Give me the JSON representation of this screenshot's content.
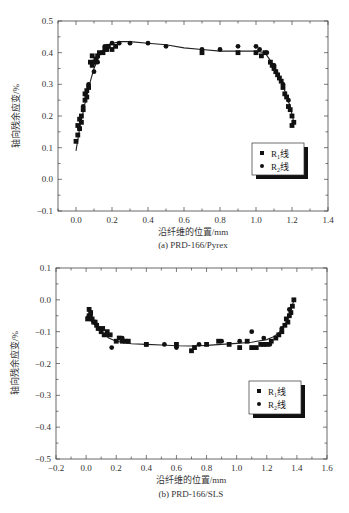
{
  "chart_data": [
    {
      "type": "scatter",
      "title": "",
      "caption": "(a) PRD-166/Pyrex",
      "xlabel": "沿纤维的位置/mm",
      "ylabel": "轴向残余应变/%",
      "xlim": [
        -0.1,
        1.4
      ],
      "ylim": [
        -0.1,
        0.5
      ],
      "xticks": [
        "0.0",
        "0.2",
        "0.4",
        "0.6",
        "0.8",
        "1.0",
        "1.2",
        "1.4"
      ],
      "xtick_values": [
        0.0,
        0.2,
        0.4,
        0.6,
        0.8,
        1.0,
        1.2,
        1.4
      ],
      "yticks": [
        "0.5",
        "0.4",
        "0.3",
        "0.2",
        "0.1",
        "0.0",
        "−0.1"
      ],
      "ytick_values": [
        0.5,
        0.4,
        0.3,
        0.2,
        0.1,
        0.0,
        -0.1
      ],
      "grid": false,
      "legend": {
        "position": "right-center",
        "entries": [
          {
            "marker": "square",
            "label_main": "R",
            "label_sub": "1",
            "label_tail": "线"
          },
          {
            "marker": "circle",
            "label_main": "R",
            "label_sub": "2",
            "label_tail": "线"
          }
        ]
      },
      "fit_curve": {
        "x": [
          0.0,
          0.02,
          0.05,
          0.08,
          0.1,
          0.13,
          0.16,
          0.2,
          0.25,
          0.3,
          0.4,
          0.5,
          0.6,
          0.7,
          0.8,
          0.9,
          1.0,
          1.05,
          1.08,
          1.1,
          1.13,
          1.16,
          1.19,
          1.21
        ],
        "y": [
          0.09,
          0.16,
          0.24,
          0.31,
          0.35,
          0.39,
          0.415,
          0.43,
          0.435,
          0.435,
          0.43,
          0.425,
          0.415,
          0.41,
          0.405,
          0.405,
          0.405,
          0.4,
          0.375,
          0.355,
          0.32,
          0.28,
          0.23,
          0.18
        ]
      },
      "series": [
        {
          "name": "R1线",
          "marker": "square",
          "x": [
            0.0,
            0.01,
            0.01,
            0.02,
            0.02,
            0.03,
            0.03,
            0.04,
            0.05,
            0.05,
            0.06,
            0.06,
            0.07,
            0.08,
            0.09,
            0.09,
            0.1,
            0.11,
            0.12,
            0.13,
            0.15,
            0.16,
            0.17,
            0.18,
            0.2,
            0.22,
            0.7,
            0.9,
            1.0,
            1.03,
            1.05,
            1.08,
            1.09,
            1.1,
            1.11,
            1.12,
            1.13,
            1.14,
            1.15,
            1.16,
            1.17,
            1.18,
            1.19,
            1.2,
            1.21,
            1.2
          ],
          "y": [
            0.12,
            0.14,
            0.17,
            0.16,
            0.19,
            0.2,
            0.18,
            0.22,
            0.25,
            0.27,
            0.26,
            0.28,
            0.29,
            0.37,
            0.36,
            0.39,
            0.37,
            0.38,
            0.39,
            0.4,
            0.4,
            0.41,
            0.41,
            0.42,
            0.41,
            0.42,
            0.4,
            0.4,
            0.4,
            0.39,
            0.4,
            0.37,
            0.36,
            0.35,
            0.34,
            0.33,
            0.32,
            0.31,
            0.29,
            0.27,
            0.26,
            0.23,
            0.22,
            0.2,
            0.18,
            0.17
          ]
        },
        {
          "name": "R2线",
          "marker": "circle",
          "x": [
            0.02,
            0.04,
            0.07,
            0.1,
            0.12,
            0.16,
            0.2,
            0.24,
            0.3,
            0.4,
            0.5,
            0.7,
            0.8,
            0.9,
            1.0,
            1.02,
            1.06,
            1.1,
            1.15,
            1.18
          ],
          "y": [
            0.16,
            0.23,
            0.3,
            0.34,
            0.37,
            0.42,
            0.43,
            0.43,
            0.43,
            0.43,
            0.42,
            0.41,
            0.41,
            0.42,
            0.42,
            0.41,
            0.4,
            0.36,
            0.3,
            0.25
          ]
        }
      ]
    },
    {
      "type": "scatter",
      "title": "",
      "caption": "(b) PRD-166/SLS",
      "xlabel": "沿纤维的位置/mm",
      "ylabel": "轴向残余应变/%",
      "xlim": [
        -0.2,
        1.6
      ],
      "ylim": [
        -0.5,
        0.1
      ],
      "xticks": [
        "−0.2",
        "0.0",
        "0.2",
        "0.4",
        "0.6",
        "0.8",
        "1.0",
        "1.2",
        "1.4",
        "1.6"
      ],
      "xtick_values": [
        -0.2,
        0.0,
        0.2,
        0.4,
        0.6,
        0.8,
        1.0,
        1.2,
        1.4,
        1.6
      ],
      "yticks": [
        "0.1",
        "0.0",
        "−0.1",
        "−0.2",
        "−0.3",
        "−0.4",
        "−0.5"
      ],
      "ytick_values": [
        0.1,
        0.0,
        -0.1,
        -0.2,
        -0.3,
        -0.4,
        -0.5
      ],
      "grid": false,
      "legend": {
        "position": "lower-right",
        "entries": [
          {
            "marker": "square",
            "label_main": "R",
            "label_sub": "1",
            "label_tail": "线"
          },
          {
            "marker": "circle",
            "label_main": "R",
            "label_sub": "2",
            "label_tail": "线"
          }
        ]
      },
      "fit_curve": {
        "x": [
          0.0,
          0.05,
          0.1,
          0.15,
          0.2,
          0.3,
          0.4,
          0.5,
          0.6,
          0.7,
          0.8,
          0.9,
          1.0,
          1.1,
          1.2,
          1.25,
          1.3,
          1.33,
          1.36,
          1.38
        ],
        "y": [
          -0.05,
          -0.075,
          -0.1,
          -0.12,
          -0.13,
          -0.138,
          -0.14,
          -0.142,
          -0.144,
          -0.145,
          -0.143,
          -0.14,
          -0.137,
          -0.133,
          -0.125,
          -0.115,
          -0.095,
          -0.07,
          -0.035,
          0.0
        ]
      },
      "series": [
        {
          "name": "R1线",
          "marker": "square",
          "x": [
            0.01,
            0.02,
            0.02,
            0.03,
            0.04,
            0.05,
            0.06,
            0.07,
            0.08,
            0.1,
            0.11,
            0.12,
            0.14,
            0.16,
            0.2,
            0.22,
            0.24,
            0.26,
            0.28,
            0.4,
            0.6,
            0.7,
            0.72,
            0.8,
            0.88,
            0.95,
            1.02,
            1.07,
            1.1,
            1.13,
            1.16,
            1.18,
            1.2,
            1.23,
            1.26,
            1.28,
            1.3,
            1.32,
            1.33,
            1.34,
            1.35,
            1.36,
            1.37,
            1.38
          ],
          "y": [
            -0.06,
            -0.03,
            -0.05,
            -0.04,
            -0.06,
            -0.07,
            -0.07,
            -0.08,
            -0.09,
            -0.1,
            -0.09,
            -0.11,
            -0.1,
            -0.11,
            -0.13,
            -0.12,
            -0.13,
            -0.13,
            -0.13,
            -0.14,
            -0.14,
            -0.16,
            -0.15,
            -0.14,
            -0.13,
            -0.14,
            -0.15,
            -0.13,
            -0.15,
            -0.15,
            -0.14,
            -0.14,
            -0.14,
            -0.13,
            -0.12,
            -0.11,
            -0.1,
            -0.08,
            -0.06,
            -0.07,
            -0.05,
            -0.04,
            -0.02,
            0.0
          ]
        },
        {
          "name": "R2线",
          "marker": "circle",
          "x": [
            0.03,
            0.09,
            0.14,
            0.17,
            0.24,
            0.4,
            0.52,
            0.6,
            0.75,
            0.9,
            1.02,
            1.1,
            1.18,
            1.22,
            1.3,
            1.35
          ],
          "y": [
            -0.05,
            -0.09,
            -0.11,
            -0.15,
            -0.12,
            -0.14,
            -0.14,
            -0.15,
            -0.14,
            -0.13,
            -0.13,
            -0.1,
            -0.12,
            -0.14,
            -0.09,
            -0.03
          ]
        }
      ]
    }
  ]
}
